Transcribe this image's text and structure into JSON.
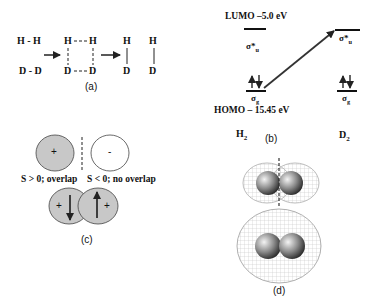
{
  "panel_a": {
    "label": "(a)",
    "reactants": [
      "H - H",
      "D - D"
    ],
    "transition": {
      "top": "H---H",
      "bottom": "D---D",
      "top_left": "H",
      "top_right": "H",
      "bottom_left": "D",
      "bottom_right": "D"
    },
    "products": [
      {
        "top": "H",
        "bottom": "D"
      },
      {
        "top": "H",
        "bottom": "D"
      }
    ]
  },
  "panel_b": {
    "label": "(b)",
    "lumo": "LUMO –5.0 eV",
    "homo": "HOMO – 15.45 eV",
    "sigma_u": "σ*",
    "sigma_u_sub": "u",
    "sigma_g": "σ",
    "sigma_g_sub": "g",
    "molecules": [
      {
        "name": "H",
        "sub": "2"
      },
      {
        "name": "D",
        "sub": "2"
      }
    ]
  },
  "panel_c": {
    "label": "(c)",
    "plus": "+",
    "minus": "-",
    "caption_left": "S > 0; overlap",
    "caption_right": "S < 0; no overlap",
    "S": "S"
  },
  "panel_d": {
    "label": "(d)"
  },
  "colors": {
    "fill_gray": "#c8c8c8",
    "line": "#222222",
    "cloud": "#bdbdbd"
  }
}
